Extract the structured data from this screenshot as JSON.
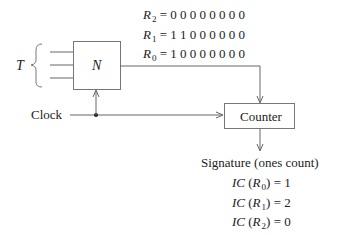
{
  "diagram": {
    "input_label": "T",
    "block_label": "N",
    "clock_label": "Clock",
    "counter_label": "Counter",
    "registers": [
      {
        "name": "R",
        "sub": "2",
        "bits": "0 0 0 0 0 0 0 0"
      },
      {
        "name": "R",
        "sub": "1",
        "bits": "1 1 0 0 0 0 0 0"
      },
      {
        "name": "R",
        "sub": "0",
        "bits": "1 0 0 0 0 0 0 0"
      }
    ],
    "signature_title": "Signature (ones count)",
    "ones_counts": [
      {
        "fn": "IC",
        "reg": "R",
        "sub": "0",
        "value": "1"
      },
      {
        "fn": "IC",
        "reg": "R",
        "sub": "1",
        "value": "2"
      },
      {
        "fn": "IC",
        "reg": "R",
        "sub": "2",
        "value": "0"
      }
    ],
    "line_color": "#666666"
  }
}
